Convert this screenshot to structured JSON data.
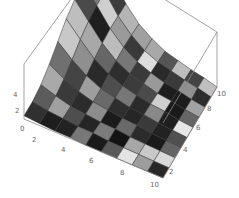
{
  "chart_data": {
    "type": "surface3d",
    "title": "",
    "xlabel": "",
    "ylabel": "",
    "zlabel": "",
    "x_ticks": [
      "2",
      "4",
      "6",
      "8",
      "10"
    ],
    "y_ticks": [
      "2",
      "4",
      "6",
      "8",
      "10"
    ],
    "z_ticks": [
      "0",
      "2",
      "4"
    ],
    "xlim": [
      1,
      10
    ],
    "ylim": [
      1,
      10
    ],
    "zlim": [
      0,
      5
    ],
    "grid_size": [
      10,
      10
    ],
    "z": [
      [
        0.3,
        0.5,
        1.0,
        1.8,
        2.8,
        3.8,
        4.5,
        4.9,
        5.0,
        5.0
      ],
      [
        0.2,
        0.3,
        0.6,
        1.1,
        1.8,
        2.6,
        3.2,
        3.6,
        3.8,
        3.9
      ],
      [
        0.1,
        0.2,
        0.3,
        0.6,
        1.0,
        1.5,
        1.9,
        2.2,
        2.3,
        2.4
      ],
      [
        0.1,
        0.1,
        0.2,
        0.3,
        0.5,
        0.8,
        1.0,
        1.2,
        1.3,
        1.3
      ],
      [
        0.0,
        0.1,
        0.1,
        0.2,
        0.3,
        0.4,
        0.5,
        0.6,
        0.6,
        0.7
      ],
      [
        0.0,
        0.0,
        0.1,
        0.1,
        0.1,
        0.2,
        0.3,
        0.3,
        0.3,
        0.3
      ],
      [
        0.0,
        0.0,
        0.0,
        0.1,
        0.1,
        0.1,
        0.1,
        0.1,
        0.2,
        0.2
      ],
      [
        0.0,
        0.0,
        0.0,
        0.0,
        0.0,
        0.1,
        0.1,
        0.1,
        0.1,
        0.1
      ],
      [
        0.0,
        0.0,
        0.0,
        0.0,
        0.0,
        0.0,
        0.0,
        0.0,
        0.1,
        0.1
      ],
      [
        0.0,
        0.0,
        0.0,
        0.0,
        0.0,
        0.0,
        0.0,
        0.0,
        0.0,
        0.0
      ]
    ],
    "cell_shades": [
      [
        "#1a1a1a",
        "#3c3c3c",
        "#b4b4b4",
        "#a0a0a0",
        "#a8a8a8",
        "#555555",
        "#bdbdbd",
        "#444444",
        "#c0c0c0",
        "#5a5a5a"
      ],
      [
        "#7a7a7a",
        "#cfcfcf",
        "#9a9a9a",
        "#3a3a3a",
        "#dcdcdc",
        "#2a2a2a",
        "#3a3a3a",
        "#909090",
        "#2d2d2d",
        "#555555"
      ],
      [
        "#4a4a4a",
        "#1f1f1f",
        "#bcbcbc",
        "#777777",
        "#3a3a3a",
        "#999999",
        "#1e1e1e",
        "#1c1c1c",
        "#a3a3a3",
        "#262626"
      ],
      [
        "#bebebe",
        "#a8a8a8",
        "#666666",
        "#2e2e2e",
        "#3c3c3c",
        "#4b4b4b",
        "#cfcfcf",
        "#1a1a1a",
        "#666666",
        "#1a1a1a"
      ],
      [
        "#c8c8c8",
        "#8f8f8f",
        "#2a2a2a",
        "#4e4e4e",
        "#777777",
        "#2a2a2a",
        "#888888",
        "#1f1f1f",
        "#e6e6e6",
        "#262626"
      ],
      [
        "#707070",
        "#444444",
        "#9e9e9e",
        "#696969",
        "#2e2e2e",
        "#262626",
        "#3a3a3a",
        "#222222",
        "#505050",
        "#888888"
      ],
      [
        "#a9a9a9",
        "#3a3a3a",
        "#2b2b2b",
        "#8c8c8c",
        "#1b1b1b",
        "#6a6a6a",
        "#2b2b2b",
        "#1a1a1a",
        "#656565",
        "#3c3c3c"
      ],
      [
        "#5c5c5c",
        "#a0a0a0",
        "#4e4e4e",
        "#252525",
        "#7b7b7b",
        "#141414",
        "#a7a7a7",
        "#c9c9c9",
        "#d9d9d9",
        "#3b3b3b"
      ],
      [
        "#303030",
        "#1e1e1e",
        "#222222",
        "#777777",
        "#1a1a1a",
        "#5a5a5a",
        "#e3e3e3",
        "#9d9d9d",
        "#282828",
        "#1a1a1a"
      ]
    ]
  }
}
